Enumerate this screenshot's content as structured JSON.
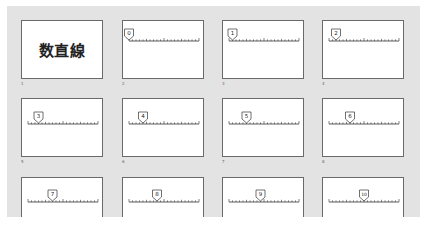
{
  "slide_sorter": {
    "slides": [
      {
        "number": "1",
        "type": "title",
        "title": "数直線"
      },
      {
        "number": "2",
        "type": "numberline",
        "marker_value": 0,
        "marker_label": "0"
      },
      {
        "number": "3",
        "type": "numberline",
        "marker_value": 1,
        "marker_label": "1"
      },
      {
        "number": "4",
        "type": "numberline",
        "marker_value": 2,
        "marker_label": "2"
      },
      {
        "number": "5",
        "type": "numberline",
        "marker_value": 3,
        "marker_label": "3"
      },
      {
        "number": "6",
        "type": "numberline",
        "marker_value": 4,
        "marker_label": "4"
      },
      {
        "number": "7",
        "type": "numberline",
        "marker_value": 5,
        "marker_label": "5"
      },
      {
        "number": "8",
        "type": "numberline",
        "marker_value": 6,
        "marker_label": "6"
      },
      {
        "number": "9",
        "type": "numberline",
        "marker_value": 7,
        "marker_label": "7"
      },
      {
        "number": "10",
        "type": "numberline",
        "marker_value": 8,
        "marker_label": "8"
      },
      {
        "number": "11",
        "type": "numberline",
        "marker_value": 9,
        "marker_label": "9"
      },
      {
        "number": "12",
        "type": "numberline",
        "marker_value": 10,
        "marker_label": "10"
      }
    ],
    "numberline": {
      "min": 0,
      "max": 20,
      "major_every": 10,
      "medium_every": 5
    },
    "colors": {
      "background": "#e3e3e3",
      "slide_border": "#6a6a6a",
      "line": "#333333"
    }
  }
}
